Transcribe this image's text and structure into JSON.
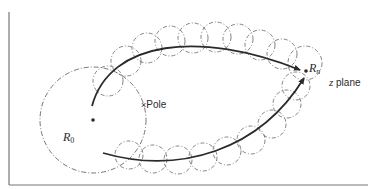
{
  "diagram": {
    "colors": {
      "stroke": "#2a2a2a",
      "dashed": "#666666",
      "frame": "#777777",
      "background": "#ffffff"
    },
    "labels": {
      "r0": {
        "main": "R",
        "sub": "0"
      },
      "rn": {
        "main": "R",
        "sub": "n"
      },
      "pole": {
        "mark": "×",
        "text": "Pole"
      },
      "plane": {
        "var": "z",
        "text": " plane"
      }
    },
    "large_circle": {
      "cx": 93,
      "cy": 120,
      "r": 53
    },
    "start_point": {
      "x": 93,
      "y": 120
    },
    "end_point": {
      "x": 306,
      "y": 71
    },
    "pole_point": {
      "x": 143,
      "y": 105
    },
    "upper_path": "M 92 106 C 110 40, 200 30, 300 70",
    "lower_path": "M 103 153 C 180 175, 260 150, 304 78",
    "upper_circles": [
      {
        "cx": 108,
        "cy": 81,
        "r": 15
      },
      {
        "cx": 126,
        "cy": 61,
        "r": 15
      },
      {
        "cx": 147,
        "cy": 48,
        "r": 15
      },
      {
        "cx": 170,
        "cy": 41,
        "r": 15
      },
      {
        "cx": 193,
        "cy": 38,
        "r": 15
      },
      {
        "cx": 216,
        "cy": 37,
        "r": 15
      },
      {
        "cx": 238,
        "cy": 39,
        "r": 15
      },
      {
        "cx": 260,
        "cy": 45,
        "r": 15
      },
      {
        "cx": 282,
        "cy": 54,
        "r": 15
      },
      {
        "cx": 305,
        "cy": 63,
        "r": 17
      }
    ],
    "lower_circles": [
      {
        "cx": 129,
        "cy": 155,
        "r": 14
      },
      {
        "cx": 153,
        "cy": 159,
        "r": 14
      },
      {
        "cx": 178,
        "cy": 160,
        "r": 14
      },
      {
        "cx": 203,
        "cy": 157,
        "r": 14
      },
      {
        "cx": 227,
        "cy": 151,
        "r": 14
      },
      {
        "cx": 251,
        "cy": 140,
        "r": 14
      },
      {
        "cx": 272,
        "cy": 124,
        "r": 14
      },
      {
        "cx": 287,
        "cy": 104,
        "r": 14
      },
      {
        "cx": 296,
        "cy": 86,
        "r": 14
      }
    ]
  }
}
